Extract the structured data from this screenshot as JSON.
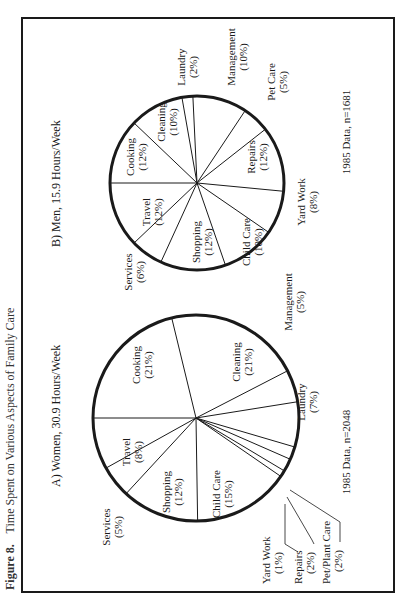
{
  "figure": {
    "caption_number": "Figure 8.",
    "caption_text": "Time Spent on Various Aspects of Family Care"
  },
  "chart_data": [
    {
      "type": "pie",
      "title": "A) Women, 30.9 Hours/Week",
      "footnote": "1985 Data, n=2048",
      "categories": [
        "Cooking",
        "Cleaning",
        "Management",
        "Laundry",
        "Pet/Plant Care",
        "Repairs",
        "Yard Work",
        "Child Care",
        "Shopping",
        "Services",
        "Travel"
      ],
      "values": [
        21,
        21,
        5,
        7,
        2,
        2,
        1,
        15,
        12,
        5,
        8
      ],
      "labels": [
        "Cooking (21%)",
        "Cleaning (21%)",
        "Management (5%)",
        "Laundry (7%)",
        "Pet/Plant Care (2%)",
        "Repairs (2%)",
        "Yard Work (1%)",
        "Child Care (15%)",
        "Shopping (12%)",
        "Services (5%)",
        "Travel (8%)"
      ]
    },
    {
      "type": "pie",
      "title": "B) Men, 15.9 Hours/Week",
      "footnote": "1985 Data, n=1681",
      "categories": [
        "Cooking",
        "Cleaning",
        "Laundry",
        "Management",
        "Pet Care",
        "Repairs",
        "Yard Work",
        "Child Care",
        "Shopping",
        "Services",
        "Travel"
      ],
      "values": [
        12,
        10,
        2,
        10,
        5,
        12,
        8,
        10,
        12,
        6,
        12
      ],
      "labels": [
        "Cooking (12%)",
        "Cleaning (10%)",
        "Laundry (2%)",
        "Management (10%)",
        "Pet Care (5%)",
        "Repairs (12%)",
        "Yard Work (8%)",
        "Child Care (10%)",
        "Shopping (12%)",
        "Services (6%)",
        "Travel (12%)"
      ]
    }
  ],
  "panels": {
    "women": {
      "title": "A)  Women, 30.9 Hours/Week",
      "footnote": "1985 Data, n=2048",
      "slices": [
        {
          "name": "Cooking",
          "pct": "(21%)"
        },
        {
          "name": "Cleaning",
          "pct": "(21%)"
        },
        {
          "name": "Management",
          "pct": "(5%)"
        },
        {
          "name": "Laundry",
          "pct": "(7%)"
        },
        {
          "name": "Pet/Plant Care",
          "pct": "(2%)"
        },
        {
          "name": "Repairs",
          "pct": "(2%)"
        },
        {
          "name": "Yard Work",
          "pct": "(1%)"
        },
        {
          "name": "Child Care",
          "pct": "(15%)"
        },
        {
          "name": "Shopping",
          "pct": "(12%)"
        },
        {
          "name": "Services",
          "pct": "(5%)"
        },
        {
          "name": "Travel",
          "pct": "(8%)"
        }
      ]
    },
    "men": {
      "title": "B)  Men, 15.9 Hours/Week",
      "footnote": "1985 Data, n=1681",
      "slices": [
        {
          "name": "Cooking",
          "pct": "(12%)"
        },
        {
          "name": "Cleaning",
          "pct": "(10%)"
        },
        {
          "name": "Laundry",
          "pct": "(2%)"
        },
        {
          "name": "Management",
          "pct": "(10%)"
        },
        {
          "name": "Pet Care",
          "pct": "(5%)"
        },
        {
          "name": "Repairs",
          "pct": "(12%)"
        },
        {
          "name": "Yard Work",
          "pct": "(8%)"
        },
        {
          "name": "Child Care",
          "pct": "(10%)"
        },
        {
          "name": "Shopping",
          "pct": "(12%)"
        },
        {
          "name": "Services",
          "pct": "(6%)"
        },
        {
          "name": "Travel",
          "pct": "(12%)"
        }
      ]
    }
  },
  "colors": {
    "ink": "#1a1a1a",
    "paper": "#ffffff"
  }
}
